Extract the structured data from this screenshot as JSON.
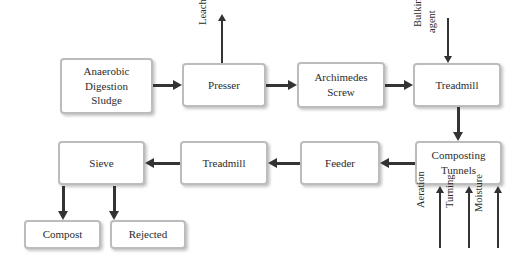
{
  "diagram": {
    "colors": {
      "node_border": "#bcbcbc",
      "node_fill": "#ffffff",
      "arrow": "#333333",
      "text": "#2b2b2b",
      "background": "#ffffff"
    },
    "nodes": [
      {
        "id": "anaerobic",
        "lines": [
          "Anaerobic",
          "Digestion",
          "Sludge"
        ]
      },
      {
        "id": "presser",
        "lines": [
          "Presser"
        ]
      },
      {
        "id": "archimedes",
        "lines": [
          "Archimedes",
          "Screw"
        ]
      },
      {
        "id": "treadmill_top",
        "lines": [
          "Treadmill"
        ]
      },
      {
        "id": "composting",
        "lines": [
          "Composting",
          "Tunnels"
        ]
      },
      {
        "id": "feeder",
        "lines": [
          "Feeder"
        ]
      },
      {
        "id": "treadmill_bottom",
        "lines": [
          "Treadmill"
        ]
      },
      {
        "id": "sieve",
        "lines": [
          "Sieve"
        ]
      },
      {
        "id": "compost",
        "lines": [
          "Compost"
        ]
      },
      {
        "id": "rejected",
        "lines": [
          "Rejected"
        ]
      }
    ],
    "edge_labels": {
      "leachate": "Leachate",
      "bulking": "Bulking",
      "agent": "agent",
      "aeration": "Aeration",
      "turning": "Turning",
      "moisture": "Moisture"
    }
  }
}
